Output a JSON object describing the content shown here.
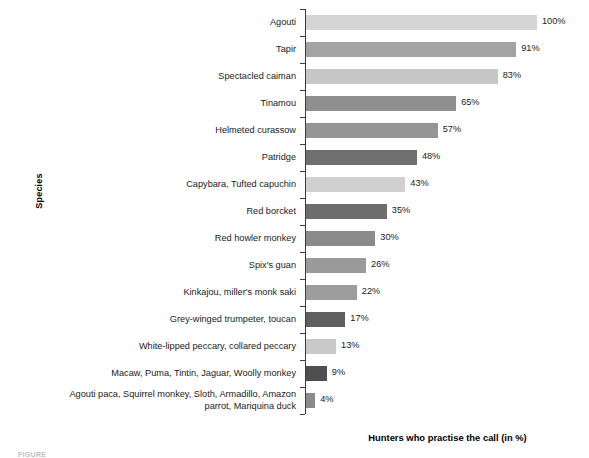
{
  "chart_data": {
    "type": "bar",
    "orientation": "horizontal",
    "title": "",
    "xlabel": "Hunters who practise the call (in %)",
    "ylabel": "Species",
    "xlim": [
      0,
      100
    ],
    "grid": false,
    "legend": null,
    "value_suffix": "%",
    "categories": [
      "Agouti",
      "Tapir",
      "Spectacled caiman",
      "Tinamou",
      "Helmeted curassow",
      "Patridge",
      "Capybara, Tufted capuchin",
      "Red borcket",
      "Red howler monkey",
      "Spix's guan",
      "Kinkajou, miller's monk saki",
      "Grey-winged trumpeter, toucan",
      "White-lipped peccary, collared peccary",
      "Macaw, Puma, Tintin, Jaguar, Woolly monkey",
      "Agouti paca, Squirrel monkey, Sloth, Armadillo, Amazon\nparrot, Mariquina duck"
    ],
    "values": [
      100,
      91,
      83,
      65,
      57,
      48,
      43,
      35,
      30,
      26,
      22,
      17,
      13,
      9,
      4
    ],
    "value_labels": [
      "100%",
      "91%",
      "83%",
      "65%",
      "57%",
      "48%",
      "43%",
      "35%",
      "30%",
      "26%",
      "22%",
      "17%",
      "13%",
      "9%",
      "4%"
    ],
    "bar_colors": [
      "#d5d5d5",
      "#a3a3a3",
      "#c6c6c6",
      "#8f8f8f",
      "#959595",
      "#6f6f6f",
      "#d0d0d0",
      "#6d6d6d",
      "#8b8b8b",
      "#9a9a9a",
      "#9d9d9d",
      "#5f5f5f",
      "#c9c9c9",
      "#4f4f4f",
      "#8a8a8a"
    ]
  },
  "caption": {
    "text": "FIGURE"
  }
}
